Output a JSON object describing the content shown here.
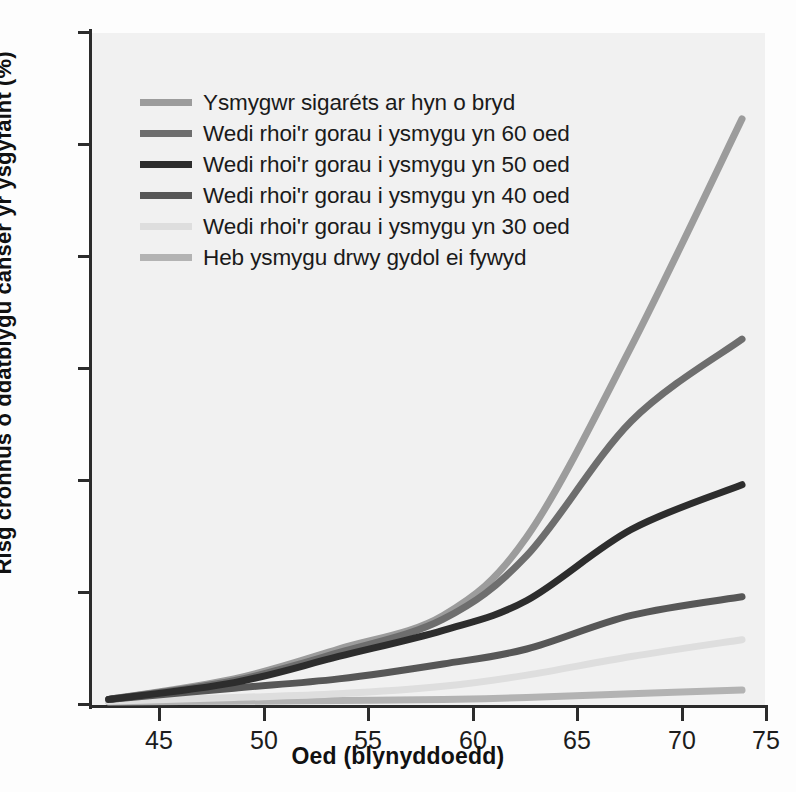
{
  "chart_data": {
    "type": "line",
    "title": "",
    "xlabel": "Oed (blynyddoedd)",
    "ylabel": "Risg cronnus o ddatblygu canser yr ysgyfaint (%)",
    "xlim": [
      43.2,
      75.4
    ],
    "ylim": [
      0,
      18
    ],
    "xticks": [
      45,
      50,
      55,
      60,
      65,
      70,
      75
    ],
    "yticks": [
      0,
      3,
      6,
      9,
      12,
      15,
      18
    ],
    "xtick_labels": [
      "45",
      "50",
      "55",
      "60",
      "65",
      "70",
      "75"
    ],
    "ytick_labels": [
      "0",
      "3",
      "6",
      "9",
      "12",
      "15",
      "18"
    ],
    "grid": false,
    "legend_position": "top-left-inside",
    "plot_background": "#f1f1f1",
    "x": [
      44,
      50,
      55,
      60,
      64,
      69,
      74.3
    ],
    "series": [
      {
        "name": "Ysmygwr sigaréts ar hyn o bryd",
        "color": "#9c9c9c",
        "values": [
          0.15,
          0.7,
          1.5,
          2.4,
          4.5,
          9.6,
          15.7
        ]
      },
      {
        "name": "Wedi rhoi'r gorau i ysmygu yn 60 oed",
        "color": "#6e6e6e",
        "values": [
          0.15,
          0.65,
          1.4,
          2.3,
          4.0,
          7.6,
          9.8
        ]
      },
      {
        "name": "Wedi rhoi'r gorau i ysmygu yn 50 oed",
        "color": "#2d2d2d",
        "values": [
          0.15,
          0.6,
          1.3,
          2.0,
          2.8,
          4.7,
          5.9
        ]
      },
      {
        "name": "Wedi rhoi'r gorau i ysmygu yn 40 oed",
        "color": "#575757",
        "values": [
          0.15,
          0.45,
          0.7,
          1.1,
          1.5,
          2.4,
          2.9
        ]
      },
      {
        "name": "Wedi rhoi'r gorau i ysmygu yn 30 oed",
        "color": "#dedede",
        "values": [
          0.1,
          0.2,
          0.3,
          0.5,
          0.8,
          1.3,
          1.75
        ]
      },
      {
        "name": "Heb ysmygu drwy gydol ei fywyd",
        "color": "#b3b3b3",
        "values": [
          0.08,
          0.1,
          0.12,
          0.15,
          0.2,
          0.3,
          0.4
        ]
      }
    ]
  },
  "legend": {
    "items": [
      {
        "label": "Ysmygwr sigaréts ar hyn o bryd",
        "color": "#9c9c9c"
      },
      {
        "label": "Wedi rhoi'r gorau i ysmygu yn 60 oed",
        "color": "#6e6e6e"
      },
      {
        "label": "Wedi rhoi'r gorau i ysmygu yn 50 oed",
        "color": "#2d2d2d"
      },
      {
        "label": "Wedi rhoi'r gorau i ysmygu yn 40 oed",
        "color": "#575757"
      },
      {
        "label": "Wedi rhoi'r gorau i ysmygu yn 30 oed",
        "color": "#dedede"
      },
      {
        "label": "Heb ysmygu drwy gydol ei fywyd",
        "color": "#b3b3b3"
      }
    ]
  },
  "axes": {
    "x_title": "Oed (blynyddoedd)",
    "y_title": "Risg cronnus o ddatblygu canser yr ysgyfaint (%)"
  }
}
